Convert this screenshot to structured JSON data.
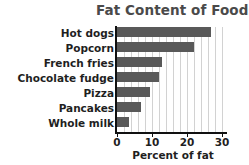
{
  "chart_data": {
    "type": "bar",
    "orientation": "horizontal",
    "title": "Fat Content of Foods",
    "xlabel": "Percent of fat",
    "ylabel": "",
    "categories": [
      "Hot dogs",
      "Popcorn",
      "French fries",
      "Chocolate fudge",
      "Pizza",
      "Pancakes",
      "Whole milk"
    ],
    "values": [
      27,
      22,
      13,
      12,
      9.5,
      7,
      3.5
    ],
    "xlim": [
      0,
      31
    ],
    "xticks": [
      0,
      10,
      20,
      30
    ],
    "xticklabels": [
      "0",
      "10",
      "20",
      "30"
    ],
    "minor_gridline_step": 2,
    "grid": true,
    "legend": null,
    "bar_color": "#595959",
    "gridline_color": "#d2d2d2",
    "axis_color": "#111111",
    "title_color": "#4a4a4a"
  }
}
